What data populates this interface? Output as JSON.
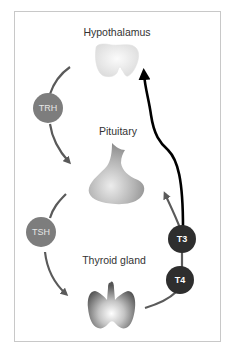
{
  "diagram": {
    "organs": [
      {
        "id": "hypothalamus",
        "label": "Hypothalamus"
      },
      {
        "id": "pituitary",
        "label": "Pituitary"
      },
      {
        "id": "thyroid",
        "label": "Thyroid gland"
      }
    ],
    "hormones": [
      {
        "id": "trh",
        "label": "TRH",
        "color": "#7d7d7d"
      },
      {
        "id": "tsh",
        "label": "TSH",
        "color": "#7d7d7d"
      },
      {
        "id": "t3",
        "label": "T3",
        "color": "#2e2e2e"
      },
      {
        "id": "t4",
        "label": "T4",
        "color": "#2e2e2e"
      }
    ],
    "edges": [
      {
        "from": "hypothalamus",
        "via": "trh",
        "to": "pituitary",
        "style": "gray-arrow"
      },
      {
        "from": "pituitary",
        "via": "tsh",
        "to": "thyroid",
        "style": "gray-arrow"
      },
      {
        "from": "thyroid",
        "via": "t4",
        "to": "t3",
        "style": "gray-line"
      },
      {
        "from": "t3",
        "to": "pituitary",
        "style": "gray-arrow"
      },
      {
        "from": "t3",
        "to": "hypothalamus",
        "style": "black-arrow"
      }
    ]
  }
}
